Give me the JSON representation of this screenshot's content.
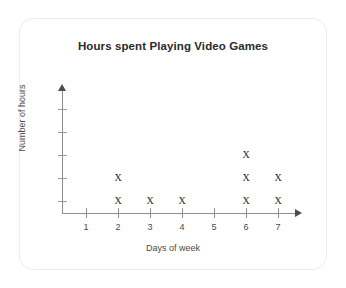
{
  "card": {
    "background_color": "#ffffff",
    "border_color": "#ececec"
  },
  "chart_data": {
    "type": "scatter",
    "title": "Hours spent Playing Video Games",
    "xlabel": "Days of week",
    "ylabel": "Number of hours",
    "categories": [
      "1",
      "2",
      "3",
      "4",
      "5",
      "6",
      "7"
    ],
    "values": [
      0,
      2,
      1,
      1,
      0,
      3,
      2
    ],
    "marker": "X",
    "marker_color": "#2b2b2b",
    "axis_color": "#8e8e8e",
    "grid": false,
    "legend": null,
    "xlim": [
      0.5,
      7.5
    ],
    "ylim": [
      0,
      6
    ],
    "y_tick_count": 5,
    "y_tick_labels": [],
    "x_tick_labels": [
      "1",
      "2",
      "3",
      "4",
      "5",
      "6",
      "7"
    ],
    "points": [
      {
        "x": 2,
        "y": 1
      },
      {
        "x": 2,
        "y": 2
      },
      {
        "x": 3,
        "y": 1
      },
      {
        "x": 4,
        "y": 1
      },
      {
        "x": 6,
        "y": 1
      },
      {
        "x": 6,
        "y": 2
      },
      {
        "x": 6,
        "y": 3
      },
      {
        "x": 7,
        "y": 1
      },
      {
        "x": 7,
        "y": 2
      }
    ],
    "axis_arrows": {
      "x_arrow": "arrow-right-icon",
      "y_arrow": "arrow-up-icon"
    }
  }
}
